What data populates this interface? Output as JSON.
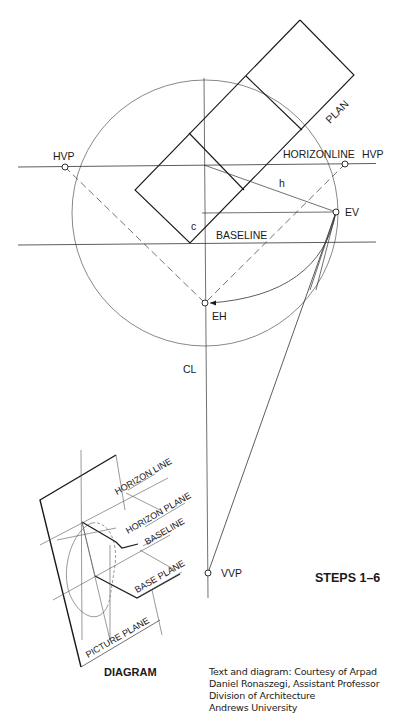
{
  "diagram": {
    "steps_label": "STEPS 1–6",
    "labels": {
      "plan": "PLAN",
      "horizon_line": "HORIZONLINE",
      "baseline": "BASELINE",
      "hvp_left": "HVP",
      "hvp_right": "HVP",
      "ev": "EV",
      "eh": "EH",
      "cl": "CL",
      "vvp": "VVP",
      "h": "h",
      "c": "c"
    },
    "inset": {
      "title": "DIAGRAM",
      "labels": {
        "horizon_line": "HORIZON LINE",
        "horizon_plane": "HORIZON PLANE",
        "baseline": "BASELINE",
        "base_plane": "BASE PLANE",
        "picture_plane": "PICTURE PLANE"
      }
    },
    "points": {
      "hvp_left": [
        65,
        167
      ],
      "hvp_right": [
        345,
        164
      ],
      "ev": [
        336,
        212
      ],
      "eh": [
        205,
        303
      ],
      "vvp": [
        208,
        573
      ]
    },
    "circle": {
      "cx": 205,
      "cy": 213,
      "r": 133
    },
    "colors": {
      "ink": "#1a1a1a",
      "thin": "#555555",
      "background": "#ffffff"
    }
  },
  "credit": {
    "lines": [
      "Text and diagram:  Courtesy of Arpad",
      "Daniel Ronaszegi, Assistant Professor",
      "Division of Architecture",
      "Andrews University"
    ]
  }
}
